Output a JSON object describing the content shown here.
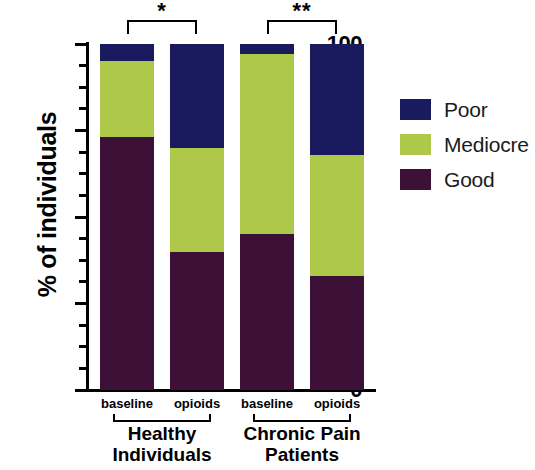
{
  "chart_data": {
    "type": "bar",
    "subtype": "stacked-100-percent",
    "title": "",
    "xlabel": "",
    "ylabel": "% of individuals",
    "ylim": [
      0,
      100
    ],
    "ytick_labels": [
      "100",
      "75",
      "50",
      "25",
      "0"
    ],
    "ytick_values": [
      100,
      75,
      50,
      25,
      0
    ],
    "yminor_ticks": [
      6.25,
      12.5,
      18.75,
      31.25,
      37.5,
      43.75,
      56.25,
      62.5,
      68.75,
      81.25,
      87.5,
      93.75
    ],
    "grid": false,
    "legend_position": "right",
    "categories": [
      "baseline",
      "opioids",
      "baseline",
      "opioids"
    ],
    "groups": [
      {
        "label": "Healthy\nIndividuals",
        "line1": "Healthy",
        "line2": "Individuals",
        "categories": [
          "baseline",
          "opioids"
        ]
      },
      {
        "label": "Chronic Pain\nPatients",
        "line1": "Chronic Pain",
        "line2": "Patients",
        "categories": [
          "baseline",
          "opioids"
        ]
      }
    ],
    "series": [
      {
        "name": "Good",
        "color": "#3d1037",
        "values": [
          73,
          40,
          45,
          33
        ]
      },
      {
        "name": "Mediocre",
        "color": "#aec94a",
        "values": [
          22,
          30,
          52,
          35
        ]
      },
      {
        "name": "Poor",
        "color": "#1a1a5e",
        "values": [
          5,
          30,
          3,
          32
        ]
      }
    ],
    "annotations": [
      {
        "type": "significance-bracket",
        "label": "*",
        "from": "Healthy Individuals baseline",
        "to": "Healthy Individuals opioids"
      },
      {
        "type": "significance-bracket",
        "label": "**",
        "from": "Chronic Pain Patients baseline",
        "to": "Chronic Pain Patients opioids"
      }
    ]
  },
  "legend": {
    "entries": [
      {
        "label": "Poor",
        "color": "#1a1a5e"
      },
      {
        "label": "Mediocre",
        "color": "#aec94a"
      },
      {
        "label": "Good",
        "color": "#3d1037"
      }
    ]
  },
  "axis": {
    "y_title": "% of individuals"
  }
}
